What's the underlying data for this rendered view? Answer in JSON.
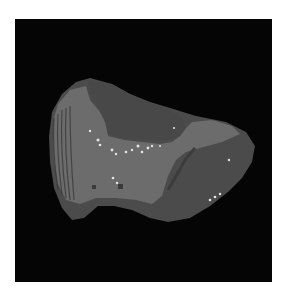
{
  "figure": {
    "background": "#ffffff",
    "panel_background": "#050505",
    "object": {
      "outer_color": "#4d4d4d",
      "light_region_color": "#6e6e6e",
      "highlight_color": "#e8e8e8"
    }
  }
}
